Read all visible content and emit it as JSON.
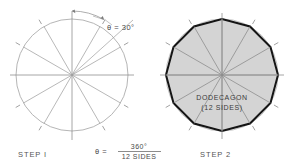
{
  "figure": {
    "title_hidden": "",
    "background_color": "#ffffff",
    "line_color": "#9a9a9a",
    "polygon_fill": "#d6d6d6",
    "polygon_stroke": "#1a1a1a",
    "text_color": "#4a4a4a"
  },
  "step1": {
    "label": "STEP I",
    "construction": "circle divided into 12 equal central angles",
    "circle": {
      "cx": 72,
      "cy": 75,
      "r": 56,
      "divisions": 12,
      "angle_step_deg": 30
    },
    "annotations": {
      "theta_symbol": "θ",
      "equals": "=",
      "theta_value": "30°",
      "theta_text": "θ = 30°",
      "formula_lhs": "θ  =",
      "formula_numerator": "360°",
      "formula_denominator": "12  SIDES",
      "formula_text": "θ = 360° / 12 SIDES"
    }
  },
  "step2": {
    "label": "STEP 2",
    "construction": "vertices joined to form the inscribed polygon",
    "circle": {
      "cx": 222,
      "cy": 75,
      "r": 56,
      "divisions": 12,
      "angle_step_deg": 30
    },
    "polygon": {
      "name": "DODECAGON",
      "sides_text": "(12 SIDES)",
      "sides": 12
    }
  }
}
